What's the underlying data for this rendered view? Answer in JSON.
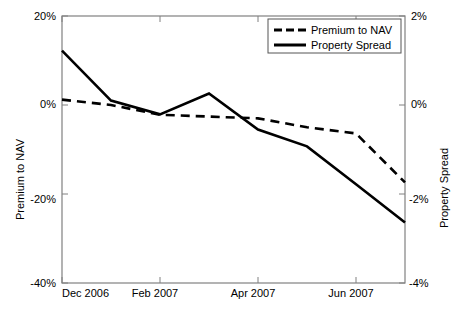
{
  "chart_data": {
    "type": "line",
    "title": "",
    "xlabel": "",
    "ylabel": "Premium to NAV",
    "y2label": "Property Spread",
    "grid": false,
    "legend_position": "top-right",
    "xlim": [
      0,
      7
    ],
    "xticks": [
      0,
      2,
      4,
      6
    ],
    "xticklabels": [
      "Dec 2006",
      "Feb 2007",
      "Apr 2007",
      "Jun 2007"
    ],
    "ylim": [
      -40,
      20
    ],
    "yticks": [
      20,
      0,
      -20,
      -40
    ],
    "yticklabels": [
      "20%",
      "0%",
      "-20%",
      "-40%"
    ],
    "y2lim": [
      -4,
      2
    ],
    "y2ticks": [
      2,
      0,
      -2,
      -4
    ],
    "y2ticklabels": [
      "2%",
      "0%",
      "-2%",
      "-4%"
    ],
    "x": [
      0,
      1,
      2,
      3,
      4,
      5,
      6,
      7
    ],
    "series": [
      {
        "name": "Premium to NAV",
        "style": "dashed",
        "color": "#000000",
        "axis": "left",
        "values": [
          1.2,
          0.0,
          -2.2,
          -2.6,
          -3.0,
          -5.0,
          -6.4,
          -17.4
        ]
      },
      {
        "name": "Property Spread",
        "style": "solid",
        "color": "#000000",
        "axis": "right",
        "values": [
          1.22,
          0.1,
          -0.21,
          0.26,
          -0.55,
          -0.93,
          -1.78,
          -2.64
        ]
      }
    ],
    "legend": [
      {
        "label": "Premium to NAV",
        "style": "dashed"
      },
      {
        "label": "Property Spread",
        "style": "solid"
      }
    ]
  }
}
